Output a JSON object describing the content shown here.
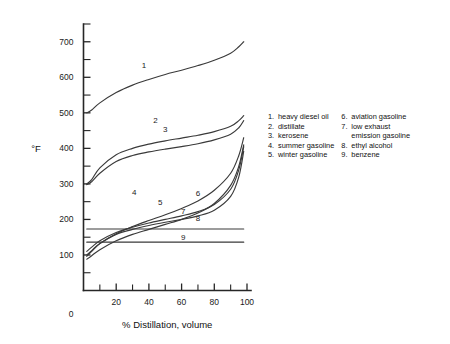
{
  "chart_data": {
    "type": "line",
    "title": "",
    "xlabel": "%  Distillation,  volume",
    "ylabel": "°F",
    "xlim": [
      0,
      100
    ],
    "ylim": [
      0,
      750
    ],
    "grid": false,
    "legend_position": "right",
    "x_ticks": [
      0,
      20,
      40,
      60,
      80,
      100
    ],
    "x_ticks_minor": [
      10,
      30,
      50,
      70,
      90
    ],
    "y_ticks": [
      100,
      200,
      300,
      400,
      500,
      600,
      700
    ],
    "y_ticks_minor": [
      50,
      150,
      250,
      350,
      450,
      550,
      650,
      750
    ],
    "x": [
      2,
      5,
      10,
      20,
      30,
      40,
      50,
      60,
      70,
      80,
      90,
      95,
      98
    ],
    "series": [
      {
        "name": "heavy diesel oil",
        "number": "1",
        "label_x": 37,
        "label_y": 625,
        "values": [
          500,
          508,
          528,
          557,
          578,
          594,
          608,
          620,
          633,
          648,
          668,
          686,
          700
        ]
      },
      {
        "name": "distillate",
        "number": "2",
        "label_x": 44,
        "label_y": 470,
        "values": [
          300,
          312,
          345,
          382,
          400,
          412,
          421,
          429,
          437,
          447,
          462,
          478,
          492
        ]
      },
      {
        "name": "kerosene",
        "number": "3",
        "label_x": 50,
        "label_y": 445,
        "values": [
          298,
          306,
          330,
          363,
          380,
          390,
          398,
          405,
          413,
          424,
          440,
          458,
          478
        ]
      },
      {
        "name": "summer gasoline",
        "number": "4",
        "label_x": 31,
        "label_y": 270,
        "values": [
          96,
          110,
          132,
          160,
          180,
          197,
          213,
          231,
          252,
          282,
          330,
          380,
          430
        ]
      },
      {
        "name": "winter gasoline",
        "number": "5",
        "label_x": 47,
        "label_y": 242,
        "values": [
          88,
          98,
          115,
          140,
          158,
          172,
          186,
          200,
          218,
          245,
          296,
          350,
          410
        ]
      },
      {
        "name": "aviation gasoline",
        "number": "6",
        "label_x": 70,
        "label_y": 267,
        "values": [
          110,
          122,
          140,
          163,
          178,
          190,
          200,
          210,
          222,
          242,
          285,
          340,
          405
        ]
      },
      {
        "name": "low exhaust emission gasoline",
        "number": "7",
        "label_x": 61,
        "label_y": 215,
        "values": [
          100,
          112,
          132,
          158,
          172,
          183,
          192,
          200,
          210,
          226,
          265,
          320,
          392
        ]
      },
      {
        "name": "ethyl alcohol",
        "number": "8",
        "label_x": 70,
        "label_y": 195,
        "values": [
          173,
          173,
          173,
          173,
          173,
          173,
          173,
          173,
          173,
          173,
          173,
          173,
          173
        ]
      },
      {
        "name": "benzene",
        "number": "9",
        "label_x": 61,
        "label_y": 142,
        "values": [
          136,
          136,
          136,
          136,
          136,
          136,
          136,
          136,
          136,
          136,
          136,
          136,
          136
        ]
      }
    ]
  },
  "legend": {
    "column_left": [
      {
        "num": "1.",
        "text": "heavy diesel oil"
      },
      {
        "num": "2.",
        "text": "distillate"
      },
      {
        "num": "3.",
        "text": "kerosene"
      },
      {
        "num": "4.",
        "text": "summer gasoline"
      },
      {
        "num": "5.",
        "text": "winter gasoline"
      }
    ],
    "column_right": [
      {
        "num": "6.",
        "text": "aviation gasoline"
      },
      {
        "num": "7.",
        "text": "low exhaust"
      },
      {
        "num": "",
        "text": "emission gasoline",
        "continuation": true
      },
      {
        "num": "8.",
        "text": "ethyl alcohol"
      },
      {
        "num": "9.",
        "text": "benzene"
      }
    ]
  },
  "colors": {
    "background": "#ffffff",
    "axis": "#262626",
    "curve": "#3a3a3a",
    "text": "#1a1a1a"
  }
}
